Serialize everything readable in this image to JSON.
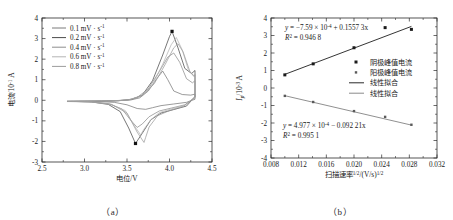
{
  "figure": {
    "panel_a_caption": "（a）",
    "panel_b_caption": "（b）"
  },
  "panel_a": {
    "xlabel": "电位/V",
    "ylabel_main": "电流/10",
    "ylabel_exp": "-1",
    "ylabel_unit": " A",
    "xticks": [
      "2.5",
      "3.0",
      "3.5",
      "4.0",
      "4.5"
    ],
    "yticks": [
      "-3",
      "-2",
      "-1",
      "0",
      "1",
      "2",
      "3",
      "4"
    ],
    "legend": [
      {
        "label": "0.1 mV · s",
        "sup": "-1",
        "color": "#7a7a7a"
      },
      {
        "label": "0.2 mV · s",
        "sup": "-1",
        "color": "#4a4a4a"
      },
      {
        "label": "0.4 mV · s",
        "sup": "-1",
        "color": "#8d8d8d"
      },
      {
        "label": "0.6 mV · s",
        "sup": "-1",
        "color": "#b4b4b4"
      },
      {
        "label": "0.8 mV · s",
        "sup": "-1",
        "color": "#9c9c9c"
      }
    ]
  },
  "panel_b": {
    "xlabel_main": "扫描速率",
    "xlabel_sup1": "1/2",
    "xlabel_mid": "/(V/s)",
    "xlabel_sup2": "1/2",
    "ylabel_main": "I",
    "ylabel_sub": "p",
    "ylabel_mid": "/10",
    "ylabel_exp": "-3",
    "ylabel_unit": " A",
    "xticks": [
      "0.008",
      "0.012",
      "0.016",
      "0.020",
      "0.024",
      "0.028",
      "0.032"
    ],
    "yticks": [
      "-4",
      "-3",
      "-2",
      "-1",
      "0",
      "1",
      "2",
      "3",
      "4"
    ],
    "eq_top": {
      "lead": "y = −7.59 × 10",
      "exp": "-4",
      "tail": " + 0.1557 3x",
      "r2_lead": "R",
      "r2_sup": "2",
      "r2_tail": " = 0.946 8"
    },
    "eq_bottom": {
      "lead": "y = 4.977 × 10",
      "exp": "-4",
      "tail": " − 0.092 21x",
      "r2_lead": "R",
      "r2_sup": "2",
      "r2_tail": " = 0.995 1"
    },
    "legend": [
      {
        "label": "阴极峰值电流",
        "kind": "square",
        "color": "#1a1a1a"
      },
      {
        "label": "阳极峰值电流",
        "kind": "square-small",
        "color": "#5a5a5a"
      },
      {
        "label": "线性拟合",
        "kind": "line",
        "color": "#2a2a2a"
      },
      {
        "label": "线性拟合",
        "kind": "line",
        "color": "#8a8a8a"
      }
    ]
  },
  "chart_data": [
    {
      "type": "line",
      "title": "",
      "panel": "a",
      "xlabel": "电位/V",
      "ylabel": "电流/10^-1 A",
      "xlim": [
        2.5,
        4.5
      ],
      "ylim": [
        -3,
        4
      ],
      "grid": false,
      "legend_position": "top-left",
      "note": "Cyclic voltammetry curves at five scan rates",
      "series": [
        {
          "name": "0.1 mV · s^-1",
          "color": "#7a7a7a",
          "anodic_peak": {
            "x": 3.92,
            "y": 1.42
          },
          "cathodic_peak": {
            "x": 3.72,
            "y": -0.44
          },
          "points": [
            [
              2.8,
              -0.05
            ],
            [
              3.0,
              -0.04
            ],
            [
              3.2,
              -0.03
            ],
            [
              3.4,
              -0.02
            ],
            [
              3.55,
              0.02
            ],
            [
              3.65,
              0.12
            ],
            [
              3.75,
              0.45
            ],
            [
              3.85,
              1.05
            ],
            [
              3.92,
              1.42
            ],
            [
              3.98,
              1.0
            ],
            [
              4.05,
              0.45
            ],
            [
              4.15,
              0.28
            ],
            [
              4.25,
              0.25
            ],
            [
              4.3,
              0.3
            ],
            [
              4.3,
              0.05
            ],
            [
              4.2,
              -0.1
            ],
            [
              4.05,
              -0.18
            ],
            [
              3.9,
              -0.26
            ],
            [
              3.8,
              -0.36
            ],
            [
              3.72,
              -0.44
            ],
            [
              3.62,
              -0.4
            ],
            [
              3.5,
              -0.22
            ],
            [
              3.35,
              -0.1
            ],
            [
              3.15,
              -0.06
            ],
            [
              2.95,
              -0.05
            ],
            [
              2.8,
              -0.05
            ]
          ]
        },
        {
          "name": "0.2 mV · s^-1",
          "color": "#4a4a4a",
          "anodic_peak": {
            "x": 4.03,
            "y": 3.35
          },
          "cathodic_peak": {
            "x": 3.6,
            "y": -2.1
          },
          "points": [
            [
              2.8,
              -0.06
            ],
            [
              3.0,
              -0.05
            ],
            [
              3.2,
              -0.04
            ],
            [
              3.4,
              -0.02
            ],
            [
              3.55,
              0.04
            ],
            [
              3.68,
              0.25
            ],
            [
              3.8,
              0.95
            ],
            [
              3.92,
              2.2
            ],
            [
              4.0,
              3.1
            ],
            [
              4.03,
              3.35
            ],
            [
              4.1,
              2.55
            ],
            [
              4.18,
              1.55
            ],
            [
              4.26,
              1.3
            ],
            [
              4.3,
              1.45
            ],
            [
              4.3,
              0.18
            ],
            [
              4.2,
              -0.28
            ],
            [
              4.05,
              -0.45
            ],
            [
              3.9,
              -0.62
            ],
            [
              3.78,
              -0.95
            ],
            [
              3.68,
              -1.6
            ],
            [
              3.6,
              -2.1
            ],
            [
              3.52,
              -1.35
            ],
            [
              3.42,
              -0.55
            ],
            [
              3.28,
              -0.2
            ],
            [
              3.08,
              -0.08
            ],
            [
              2.9,
              -0.06
            ],
            [
              2.8,
              -0.06
            ]
          ]
        },
        {
          "name": "0.4 mV · s^-1",
          "color": "#8d8d8d",
          "anodic_peak": {
            "x": 4.05,
            "y": 2.3
          },
          "cathodic_peak": {
            "x": 3.62,
            "y": -1.32
          },
          "points": [
            [
              2.8,
              -0.05
            ],
            [
              3.05,
              -0.04
            ],
            [
              3.3,
              -0.03
            ],
            [
              3.5,
              0.01
            ],
            [
              3.62,
              0.14
            ],
            [
              3.75,
              0.55
            ],
            [
              3.88,
              1.4
            ],
            [
              3.98,
              2.1
            ],
            [
              4.05,
              2.3
            ],
            [
              4.12,
              1.85
            ],
            [
              4.2,
              1.05
            ],
            [
              4.27,
              0.85
            ],
            [
              4.3,
              0.95
            ],
            [
              4.3,
              0.12
            ],
            [
              4.18,
              -0.22
            ],
            [
              4.02,
              -0.38
            ],
            [
              3.88,
              -0.52
            ],
            [
              3.76,
              -0.8
            ],
            [
              3.68,
              -1.15
            ],
            [
              3.62,
              -1.32
            ],
            [
              3.54,
              -0.95
            ],
            [
              3.44,
              -0.42
            ],
            [
              3.28,
              -0.16
            ],
            [
              3.05,
              -0.07
            ],
            [
              2.8,
              -0.05
            ]
          ]
        },
        {
          "name": "0.6 mV · s^-1",
          "color": "#b4b4b4",
          "anodic_peak": {
            "x": 4.08,
            "y": 3.05
          },
          "cathodic_peak": {
            "x": 3.66,
            "y": -1.68
          },
          "points": [
            [
              2.8,
              -0.05
            ],
            [
              3.05,
              -0.04
            ],
            [
              3.3,
              -0.03
            ],
            [
              3.52,
              0.02
            ],
            [
              3.66,
              0.2
            ],
            [
              3.8,
              0.75
            ],
            [
              3.92,
              1.75
            ],
            [
              4.02,
              2.7
            ],
            [
              4.08,
              3.05
            ],
            [
              4.15,
              2.45
            ],
            [
              4.22,
              1.5
            ],
            [
              4.28,
              1.2
            ],
            [
              4.3,
              1.3
            ],
            [
              4.3,
              0.15
            ],
            [
              4.18,
              -0.25
            ],
            [
              4.02,
              -0.42
            ],
            [
              3.88,
              -0.6
            ],
            [
              3.78,
              -0.95
            ],
            [
              3.7,
              -1.4
            ],
            [
              3.66,
              -1.68
            ],
            [
              3.58,
              -1.2
            ],
            [
              3.48,
              -0.5
            ],
            [
              3.3,
              -0.18
            ],
            [
              3.05,
              -0.07
            ],
            [
              2.8,
              -0.05
            ]
          ]
        },
        {
          "name": "0.8 mV · s^-1",
          "color": "#9c9c9c",
          "anodic_peak": {
            "x": 4.1,
            "y": 2.75
          },
          "cathodic_peak": {
            "x": 3.7,
            "y": -2.05
          },
          "points": [
            [
              2.8,
              -0.06
            ],
            [
              3.08,
              -0.05
            ],
            [
              3.32,
              -0.04
            ],
            [
              3.54,
              0.03
            ],
            [
              3.68,
              0.22
            ],
            [
              3.82,
              0.8
            ],
            [
              3.95,
              1.75
            ],
            [
              4.05,
              2.55
            ],
            [
              4.1,
              2.75
            ],
            [
              4.16,
              2.35
            ],
            [
              4.24,
              1.4
            ],
            [
              4.29,
              1.15
            ],
            [
              4.3,
              1.25
            ],
            [
              4.3,
              0.16
            ],
            [
              4.16,
              -0.3
            ],
            [
              4.0,
              -0.5
            ],
            [
              3.86,
              -0.75
            ],
            [
              3.76,
              -1.3
            ],
            [
              3.72,
              -1.8
            ],
            [
              3.7,
              -2.05
            ],
            [
              3.62,
              -1.55
            ],
            [
              3.5,
              -0.62
            ],
            [
              3.32,
              -0.2
            ],
            [
              3.08,
              -0.08
            ],
            [
              2.8,
              -0.06
            ]
          ]
        }
      ]
    },
    {
      "type": "scatter",
      "panel": "b",
      "title": "",
      "xlabel": "扫描速率^1/2/(V/s)^1/2",
      "ylabel": "Ip/10^-3 A",
      "xlim": [
        0.008,
        0.032
      ],
      "ylim": [
        -4,
        4
      ],
      "grid": false,
      "legend_position": "center-right",
      "series": [
        {
          "name": "阴极峰值电流",
          "marker": "square",
          "color": "#1a1a1a",
          "x": [
            0.01,
            0.0141,
            0.02,
            0.0245,
            0.0283
          ],
          "y": [
            0.75,
            1.38,
            2.3,
            3.45,
            3.35
          ]
        },
        {
          "name": "阳极峰值电流",
          "marker": "square-small",
          "color": "#5a5a5a",
          "x": [
            0.01,
            0.0141,
            0.02,
            0.0245,
            0.0283
          ],
          "y": [
            -0.45,
            -0.8,
            -1.32,
            -1.65,
            -2.1
          ]
        },
        {
          "name": "线性拟合 (上)",
          "marker": "line",
          "color": "#2a2a2a",
          "equation": "y = -7.59e-4 + 0.15573x",
          "r2": 0.9468,
          "x": [
            0.01,
            0.0283
          ],
          "y": [
            0.78,
            3.52
          ]
        },
        {
          "name": "线性拟合 (下)",
          "marker": "line",
          "color": "#8a8a8a",
          "equation": "y = 4.977e-4 - 0.09221x",
          "r2": 0.9951,
          "x": [
            0.01,
            0.0283
          ],
          "y": [
            -0.44,
            -2.12
          ]
        }
      ]
    }
  ]
}
